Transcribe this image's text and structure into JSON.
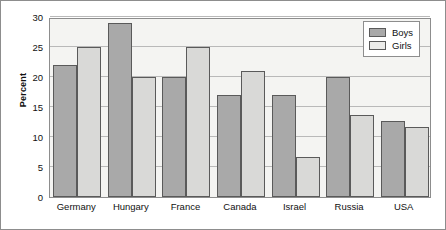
{
  "chart_data": {
    "type": "bar",
    "title": "",
    "xlabel": "",
    "ylabel": "Percent",
    "ylim": [
      0,
      30
    ],
    "yticks": [
      0,
      5,
      10,
      15,
      20,
      25,
      30
    ],
    "ytick_labels": [
      "0",
      "5",
      "10",
      "15",
      "20",
      "25",
      "30"
    ],
    "grid": true,
    "legend_position": "top-right",
    "categories": [
      "Germany",
      "Hungary",
      "France",
      "Canada",
      "Israel",
      "Russia",
      "USA"
    ],
    "series": [
      {
        "name": "Boys",
        "color": "#a9a9a9",
        "values": [
          22,
          29,
          20,
          17,
          17,
          20,
          12.7
        ]
      },
      {
        "name": "Girls",
        "color": "#d9d9d7",
        "values": [
          25,
          20,
          25,
          21,
          6.7,
          13.7,
          11.7
        ]
      }
    ]
  }
}
